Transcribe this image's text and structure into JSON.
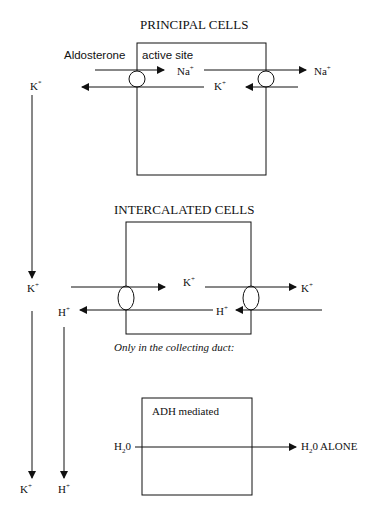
{
  "principal": {
    "title": "PRINCIPAL CELLS",
    "aldosterone": "Aldosterone",
    "active_site": "active site",
    "na_in": "Na",
    "na_out": "Na",
    "k_mid": "K",
    "k_left": "K",
    "k_left_sup": "*",
    "plus": "+"
  },
  "intercalated": {
    "title": "INTERCALATED CELLS",
    "k_left": "K",
    "k_mid": "K",
    "k_right": "K",
    "h_left": "H",
    "h_mid": "H",
    "plus": "+",
    "note": "Only in the collecting duct:"
  },
  "adh": {
    "label": "ADH mediated",
    "h2o_in_a": "H",
    "h2o_in_sub": "2",
    "h2o_in_b": "0",
    "h2o_out_a": "H",
    "h2o_out_sub": "2",
    "h2o_out_b": "0 ALONE"
  },
  "bottom": {
    "k": "K",
    "h": "H",
    "plus": "+"
  }
}
